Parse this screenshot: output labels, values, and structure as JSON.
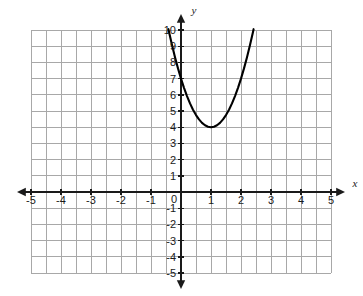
{
  "chart_data": {
    "type": "line",
    "title": "",
    "subtitle": "",
    "xlabel": "x",
    "ylabel": "y",
    "xlim": [
      -5,
      5
    ],
    "ylim": [
      -5,
      10
    ],
    "grid": true,
    "legend": null,
    "x_ticks": [
      -5,
      -4,
      -3,
      -2,
      -1,
      0,
      1,
      2,
      3,
      4,
      5
    ],
    "x_tick_labels": [
      "‑5",
      "‑4",
      "‑3",
      "‑2",
      "‑1",
      "0",
      "1",
      "2",
      "3",
      "4",
      "5"
    ],
    "y_ticks": [
      -5,
      -4,
      -3,
      -2,
      -1,
      1,
      2,
      3,
      4,
      5,
      6,
      7,
      8,
      9,
      10
    ],
    "y_tick_labels": [
      "‑5",
      "‑4",
      "‑3",
      "‑2",
      "‑1",
      "1",
      "2",
      "3",
      "4",
      "5",
      "6",
      "7",
      "8",
      "9",
      "10"
    ],
    "origin_label": "0",
    "series": [
      {
        "name": "parabola",
        "equation": "y = 3(x - 1)^2 + 4",
        "vertex": [
          1,
          4
        ],
        "color": "#000000",
        "x": [
          -0.42,
          -0.3,
          -0.2,
          -0.1,
          0,
          0.1,
          0.2,
          0.3,
          0.4,
          0.5,
          0.6,
          0.7,
          0.8,
          0.9,
          1,
          1.1,
          1.2,
          1.3,
          1.4,
          1.5,
          1.6,
          1.7,
          1.8,
          1.9,
          2,
          2.1,
          2.2,
          2.3,
          2.4,
          2.42
        ],
        "y": [
          10.05,
          9.07,
          8.32,
          7.63,
          7.0,
          6.43,
          5.92,
          5.47,
          5.08,
          4.75,
          4.48,
          4.27,
          4.12,
          4.03,
          4.0,
          4.03,
          4.12,
          4.27,
          4.48,
          4.75,
          5.08,
          5.47,
          5.92,
          6.43,
          7.0,
          7.63,
          8.32,
          9.07,
          9.88,
          10.05
        ]
      }
    ],
    "axis_arrows": {
      "x_left": true,
      "x_right": true,
      "y_up": true,
      "y_down": true
    },
    "colors": {
      "curve": "#000000",
      "axis": "#1a1a1a",
      "grid": "#a8a8a8",
      "background": "#ffffff",
      "tick_label": "#1a1a1a"
    }
  }
}
